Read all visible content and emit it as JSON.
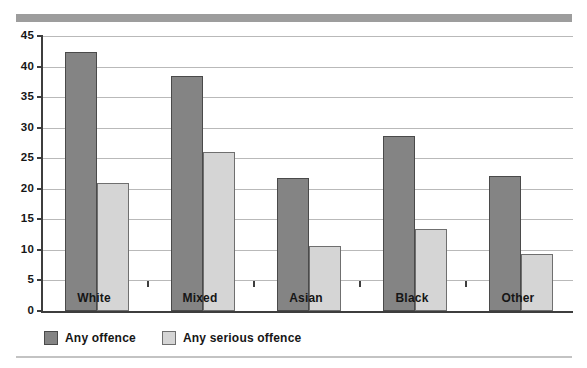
{
  "chart_data": {
    "type": "bar",
    "title": "",
    "xlabel": "",
    "ylabel": "",
    "ylim": [
      0,
      45
    ],
    "ytick_step": 5,
    "yticks": [
      45,
      40,
      35,
      30,
      25,
      20,
      15,
      10,
      5,
      0
    ],
    "grid": true,
    "legend_position": "bottom-left",
    "categories": [
      "White",
      "Mixed",
      "Asian",
      "Black",
      "Other"
    ],
    "series": [
      {
        "name": "Any offence",
        "color": "#848484",
        "values": [
          42.4,
          38.5,
          21.7,
          28.7,
          22.1
        ]
      },
      {
        "name": "Any serious offence",
        "color": "#d5d5d5",
        "values": [
          21.0,
          26.0,
          10.6,
          13.5,
          9.3
        ]
      }
    ]
  },
  "decor": {
    "top_banner_color": "#9d9d9d",
    "bottom_rule_color": "#c3c3c3",
    "axis_color": "#3d3d3d",
    "gridline_color": "#b9b9b9"
  }
}
